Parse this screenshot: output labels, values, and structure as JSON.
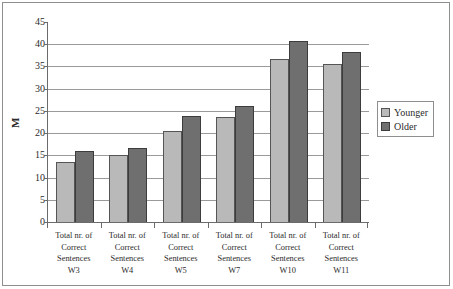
{
  "chart_data": {
    "type": "bar",
    "title": "",
    "subtitle": "",
    "xlabel": "",
    "ylabel": "M",
    "ylim": [
      0,
      45
    ],
    "ytick_step": 5,
    "yticks": [
      45,
      40,
      35,
      30,
      25,
      20,
      15,
      10,
      5,
      0
    ],
    "grid": true,
    "grid_axis": "y",
    "legend_position": "right",
    "categories": [
      "Total nr. of Correct Sentences W3",
      "Total nr. of Correct Sentences W4",
      "Total nr. of Correct Sentences W5",
      "Total nr. of Correct Sentences W7",
      "Total nr. of Correct Sentences W10",
      "Total nr. of Correct Sentences W11"
    ],
    "category_lines": [
      [
        "Total nr. of",
        "Correct",
        "Sentences",
        "W3"
      ],
      [
        "Total nr. of",
        "Correct",
        "Sentences",
        "W4"
      ],
      [
        "Total nr. of",
        "Correct",
        "Sentences",
        "W5"
      ],
      [
        "Total nr. of",
        "Correct",
        "Sentences",
        "W7"
      ],
      [
        "Total nr. of",
        "Correct",
        "Sentences",
        "W10"
      ],
      [
        "Total nr. of",
        "Correct",
        "Sentences",
        "W11"
      ]
    ],
    "series": [
      {
        "name": "Younger",
        "color": "#b9b9b9",
        "values": [
          13.5,
          15.0,
          20.5,
          23.6,
          36.6,
          35.5
        ]
      },
      {
        "name": "Older",
        "color": "#6f6f6f",
        "values": [
          16.0,
          16.6,
          23.8,
          26.2,
          40.8,
          38.3
        ]
      }
    ]
  },
  "legend": {
    "entries": [
      {
        "label": "Younger",
        "color": "#b9b9b9"
      },
      {
        "label": "Older",
        "color": "#6f6f6f"
      }
    ]
  },
  "axes": {
    "y_title": "M",
    "y_tick_labels": [
      "45",
      "40",
      "35",
      "30",
      "25",
      "20",
      "15",
      "10",
      "5",
      "0"
    ]
  },
  "colors": {
    "series_younger": "#b9b9b9",
    "series_older": "#6f6f6f",
    "gridline": "#9a9a9a",
    "axis": "#6b6b6b",
    "frame": "#8e8e8e",
    "text": "#2b2b2b",
    "background": "#ffffff"
  }
}
